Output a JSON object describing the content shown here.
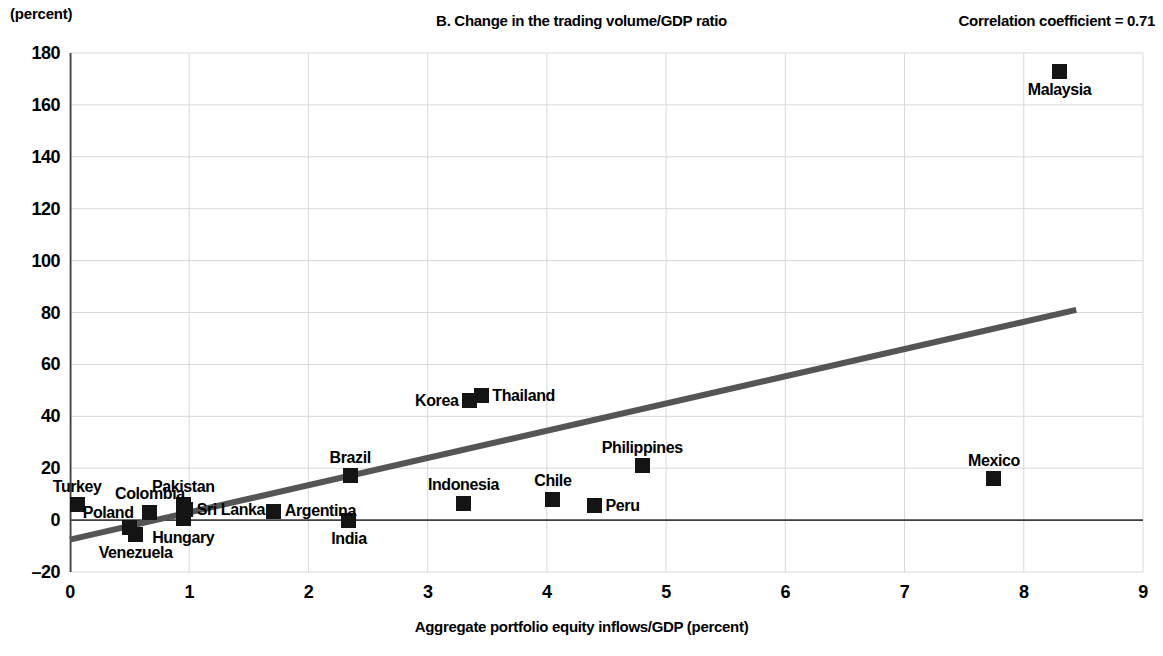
{
  "header": {
    "unit_label": "(percent)",
    "title": "B. Change in the trading volume/GDP ratio",
    "correlation_label": "Correlation coefficient = 0.71"
  },
  "axes": {
    "x_title": "Aggregate portfolio equity inflows/GDP (percent)",
    "y_ticks": [
      "180",
      "160",
      "140",
      "120",
      "100",
      "80",
      "60",
      "40",
      "20",
      "0",
      "–20"
    ],
    "x_ticks": [
      "0",
      "1",
      "2",
      "3",
      "4",
      "5",
      "6",
      "7",
      "8",
      "9"
    ]
  },
  "footnote": "",
  "colors": {
    "marker": "#141414",
    "trendline": "#555555",
    "gridline": "#d9d9d9",
    "axisline": "#404040",
    "background": "#ffffff"
  },
  "chart_data": {
    "type": "scatter",
    "title": "B. Change in the trading volume/GDP ratio",
    "xlabel": "Aggregate portfolio equity inflows/GDP (percent)",
    "ylabel": "(percent)",
    "xlim": [
      0,
      9
    ],
    "ylim": [
      -20,
      180
    ],
    "xticks": [
      0,
      1,
      2,
      3,
      4,
      5,
      6,
      7,
      8,
      9
    ],
    "yticks": [
      -20,
      0,
      20,
      40,
      60,
      80,
      100,
      120,
      140,
      160,
      180
    ],
    "grid": true,
    "legend": false,
    "annotations": [
      "Correlation coefficient = 0.71"
    ],
    "correlation_coefficient": 0.71,
    "trendline": {
      "x0": 0,
      "y0": -7.5,
      "x1": 8.44,
      "y1": 81
    },
    "points": [
      {
        "label": "Turkey",
        "x": 0.06,
        "y": 6.0,
        "label_pos": "above"
      },
      {
        "label": "Poland",
        "x": 0.5,
        "y": -3.0,
        "label_pos": "above-left"
      },
      {
        "label": "Venezuela",
        "x": 0.55,
        "y": -5.5,
        "label_pos": "below"
      },
      {
        "label": "Colombia",
        "x": 0.67,
        "y": 3.0,
        "label_pos": "above"
      },
      {
        "label": "Pakistan",
        "x": 0.95,
        "y": 6.0,
        "label_pos": "above"
      },
      {
        "label": "Hungary",
        "x": 0.95,
        "y": 0.5,
        "label_pos": "below"
      },
      {
        "label": "Sri Lanka",
        "x": 0.97,
        "y": 4.0,
        "label_pos": "right"
      },
      {
        "label": "Argentina",
        "x": 1.71,
        "y": 3.5,
        "label_pos": "right"
      },
      {
        "label": "India",
        "x": 2.34,
        "y": 0.0,
        "label_pos": "below"
      },
      {
        "label": "Brazil",
        "x": 2.35,
        "y": 17.0,
        "label_pos": "above"
      },
      {
        "label": "Indonesia",
        "x": 3.3,
        "y": 6.5,
        "label_pos": "above"
      },
      {
        "label": "Korea",
        "x": 3.35,
        "y": 46.0,
        "label_pos": "left"
      },
      {
        "label": "Thailand",
        "x": 3.45,
        "y": 48.0,
        "label_pos": "right"
      },
      {
        "label": "Chile",
        "x": 4.05,
        "y": 8.0,
        "label_pos": "above"
      },
      {
        "label": "Peru",
        "x": 4.4,
        "y": 5.5,
        "label_pos": "right"
      },
      {
        "label": "Philippines",
        "x": 4.8,
        "y": 21.0,
        "label_pos": "above"
      },
      {
        "label": "Mexico",
        "x": 7.75,
        "y": 16.0,
        "label_pos": "above"
      },
      {
        "label": "Malaysia",
        "x": 8.3,
        "y": 173.0,
        "label_pos": "below"
      }
    ]
  }
}
